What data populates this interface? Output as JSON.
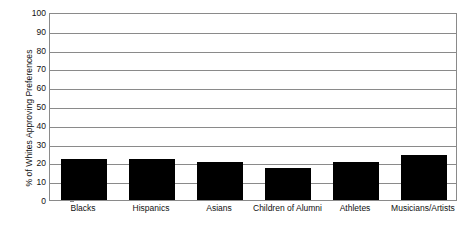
{
  "chart_data": {
    "type": "bar",
    "title": "",
    "subtitle": "",
    "xlabel": "",
    "ylabel": "% of Whites Approving Preferences",
    "categories": [
      "Blacks",
      "Hispanics",
      "Asians",
      "Children of Alumni",
      "Athletes",
      "Musicians/Artists"
    ],
    "values": [
      22,
      22,
      20,
      17,
      20,
      24
    ],
    "ylim": [
      0,
      100
    ],
    "ytick_labels": [
      "0",
      "10",
      "20",
      "30",
      "40",
      "50",
      "60",
      "70",
      "80",
      "90",
      "100"
    ],
    "ytick_values": [
      0,
      10,
      20,
      30,
      40,
      50,
      60,
      70,
      80,
      90,
      100
    ],
    "grid": true,
    "legend": false,
    "legend_position": "none",
    "bar_color": "#000000",
    "grid_color": "#8a8a8a",
    "axis_color": "#8a8a8a",
    "background_color": "#ffffff"
  }
}
